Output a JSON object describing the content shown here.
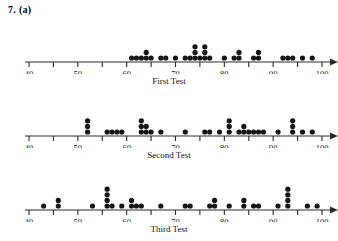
{
  "header": {
    "label": "7. (a)"
  },
  "chart_data": [
    {
      "type": "dotplot",
      "title": "First Test",
      "xlabel": "",
      "ylabel": "",
      "xlim": [
        40,
        100
      ],
      "ticks": [
        40,
        45,
        50,
        55,
        60,
        65,
        70,
        75,
        80,
        85,
        90,
        95,
        100
      ],
      "tick_labels": [
        "40",
        "",
        "50",
        "",
        "60",
        "",
        "70",
        "",
        "80",
        "",
        "90",
        "",
        "100"
      ],
      "grid": false,
      "values": [
        {
          "x": 61,
          "count": 1
        },
        {
          "x": 62,
          "count": 1
        },
        {
          "x": 63,
          "count": 1
        },
        {
          "x": 64,
          "count": 2
        },
        {
          "x": 65,
          "count": 1
        },
        {
          "x": 67,
          "count": 1
        },
        {
          "x": 68,
          "count": 1
        },
        {
          "x": 70,
          "count": 1
        },
        {
          "x": 72,
          "count": 1
        },
        {
          "x": 73,
          "count": 1
        },
        {
          "x": 74,
          "count": 3
        },
        {
          "x": 75,
          "count": 1
        },
        {
          "x": 76,
          "count": 3
        },
        {
          "x": 77,
          "count": 1
        },
        {
          "x": 80,
          "count": 1
        },
        {
          "x": 82,
          "count": 1
        },
        {
          "x": 83,
          "count": 2
        },
        {
          "x": 86,
          "count": 1
        },
        {
          "x": 87,
          "count": 2
        },
        {
          "x": 92,
          "count": 1
        },
        {
          "x": 93,
          "count": 1
        },
        {
          "x": 94,
          "count": 1
        },
        {
          "x": 96,
          "count": 1
        },
        {
          "x": 98,
          "count": 1
        }
      ]
    },
    {
      "type": "dotplot",
      "title": "Second Test",
      "xlabel": "",
      "ylabel": "",
      "xlim": [
        40,
        100
      ],
      "ticks": [
        40,
        45,
        50,
        55,
        60,
        65,
        70,
        75,
        80,
        85,
        90,
        95,
        100
      ],
      "tick_labels": [
        "40",
        "",
        "50",
        "",
        "60",
        "",
        "70",
        "",
        "80",
        "",
        "90",
        "",
        "100"
      ],
      "grid": false,
      "values": [
        {
          "x": 52,
          "count": 3
        },
        {
          "x": 56,
          "count": 1
        },
        {
          "x": 57,
          "count": 1
        },
        {
          "x": 58,
          "count": 1
        },
        {
          "x": 59,
          "count": 1
        },
        {
          "x": 63,
          "count": 3
        },
        {
          "x": 64,
          "count": 2
        },
        {
          "x": 65,
          "count": 1
        },
        {
          "x": 67,
          "count": 1
        },
        {
          "x": 72,
          "count": 1
        },
        {
          "x": 76,
          "count": 1
        },
        {
          "x": 77,
          "count": 1
        },
        {
          "x": 79,
          "count": 1
        },
        {
          "x": 81,
          "count": 3
        },
        {
          "x": 83,
          "count": 1
        },
        {
          "x": 84,
          "count": 2
        },
        {
          "x": 85,
          "count": 1
        },
        {
          "x": 86,
          "count": 1
        },
        {
          "x": 87,
          "count": 1
        },
        {
          "x": 88,
          "count": 1
        },
        {
          "x": 91,
          "count": 1
        },
        {
          "x": 94,
          "count": 3
        },
        {
          "x": 96,
          "count": 1
        },
        {
          "x": 98,
          "count": 1
        }
      ]
    },
    {
      "type": "dotplot",
      "title": "Third Test",
      "xlabel": "",
      "ylabel": "",
      "xlim": [
        40,
        100
      ],
      "ticks": [
        40,
        45,
        50,
        55,
        60,
        65,
        70,
        75,
        80,
        85,
        90,
        95,
        100
      ],
      "tick_labels": [
        "40",
        "",
        "50",
        "",
        "60",
        "",
        "70",
        "",
        "80",
        "",
        "90",
        "",
        "100"
      ],
      "grid": false,
      "values": [
        {
          "x": 43,
          "count": 1
        },
        {
          "x": 46,
          "count": 2
        },
        {
          "x": 53,
          "count": 1
        },
        {
          "x": 56,
          "count": 4
        },
        {
          "x": 57,
          "count": 1
        },
        {
          "x": 59,
          "count": 1
        },
        {
          "x": 61,
          "count": 2
        },
        {
          "x": 62,
          "count": 1
        },
        {
          "x": 63,
          "count": 1
        },
        {
          "x": 67,
          "count": 1
        },
        {
          "x": 72,
          "count": 1
        },
        {
          "x": 73,
          "count": 1
        },
        {
          "x": 77,
          "count": 1
        },
        {
          "x": 78,
          "count": 2
        },
        {
          "x": 81,
          "count": 1
        },
        {
          "x": 84,
          "count": 2
        },
        {
          "x": 86,
          "count": 1
        },
        {
          "x": 87,
          "count": 1
        },
        {
          "x": 91,
          "count": 1
        },
        {
          "x": 93,
          "count": 4
        },
        {
          "x": 97,
          "count": 1
        },
        {
          "x": 99,
          "count": 1
        }
      ]
    }
  ]
}
